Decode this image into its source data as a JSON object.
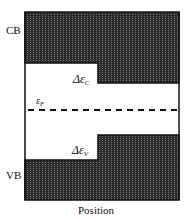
{
  "diagram": {
    "type": "band-diagram",
    "labels": {
      "conduction_band": "CB",
      "valence_band": "VB",
      "x_axis": "Position",
      "fermi_level": {
        "symbol": "ε",
        "subscript": "F"
      },
      "conduction_offset": {
        "prefix": "Δε",
        "subscript": "C"
      },
      "valence_offset": {
        "prefix": "Δε",
        "subscript": "V"
      }
    },
    "colors": {
      "band_fill": "#2b2b2b",
      "band_texture": "#6a6a6a",
      "outline": "#111111",
      "gap": "#ffffff",
      "fermi_line": "#111111"
    }
  }
}
